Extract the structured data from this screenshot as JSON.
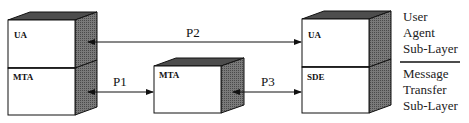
{
  "diagram": {
    "type": "protocol-layer-diagram",
    "colors": {
      "box_face": "#ffffff",
      "box_side": "#6a6a6a",
      "box_top": "#555555",
      "stroke": "#111111"
    },
    "nodes": [
      {
        "id": "left-ua",
        "label": "UA",
        "layer": "user-agent"
      },
      {
        "id": "left-mta",
        "label": "MTA",
        "layer": "message-transfer"
      },
      {
        "id": "middle-mta",
        "label": "MTA",
        "layer": "message-transfer"
      },
      {
        "id": "right-ua",
        "label": "UA",
        "layer": "user-agent"
      },
      {
        "id": "right-sde",
        "label": "SDE",
        "layer": "message-transfer"
      }
    ],
    "edges": [
      {
        "from": "left-ua",
        "to": "right-ua",
        "label": "P2",
        "bidirectional": true
      },
      {
        "from": "left-mta",
        "to": "middle-mta",
        "label": "P1",
        "bidirectional": true
      },
      {
        "from": "middle-mta",
        "to": "right-sde",
        "label": "P3",
        "bidirectional": true
      }
    ],
    "legend": {
      "upper": [
        "User",
        "Agent",
        "Sub-Layer"
      ],
      "lower": [
        "Message",
        "Transfer",
        "Sub-Layer"
      ]
    }
  }
}
